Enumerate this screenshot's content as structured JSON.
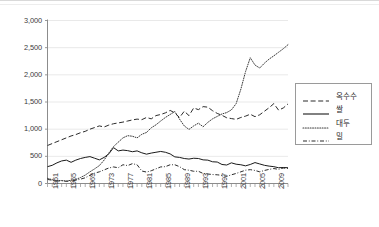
{
  "chart_data": {
    "type": "line",
    "title": "",
    "subtitle": "",
    "xlabel": "",
    "ylabel": "",
    "xlim": [
      1961,
      2012
    ],
    "ylim": [
      0,
      3000
    ],
    "grid": true,
    "grid_axis": "y",
    "legend_position": "right",
    "y_ticks": [
      0,
      500,
      1000,
      1500,
      2000,
      2500,
      3000
    ],
    "y_tick_labels": [
      "0",
      "500",
      "1,000",
      "1,500",
      "2,000",
      "2,500",
      "3,000"
    ],
    "x_tick_labels": [
      "1961",
      "1965",
      "1969",
      "1973",
      "1977",
      "1981",
      "1985",
      "1989",
      "1993",
      "1997",
      "2001",
      "2005",
      "2009"
    ],
    "x_tick_years": [
      1961,
      1965,
      1969,
      1973,
      1977,
      1981,
      1985,
      1989,
      1993,
      1997,
      2001,
      2005,
      2009
    ],
    "x": [
      1961,
      1962,
      1963,
      1964,
      1965,
      1966,
      1967,
      1968,
      1969,
      1970,
      1971,
      1972,
      1973,
      1974,
      1975,
      1976,
      1977,
      1978,
      1979,
      1980,
      1981,
      1982,
      1983,
      1984,
      1985,
      1986,
      1987,
      1988,
      1989,
      1990,
      1991,
      1992,
      1993,
      1994,
      1995,
      1996,
      1997,
      1998,
      1999,
      2000,
      2001,
      2002,
      2003,
      2004,
      2005,
      2006,
      2007,
      2008,
      2009,
      2010,
      2011,
      2012
    ],
    "series": [
      {
        "name": "옥수수",
        "style": "dashed",
        "color": "#2b2b2b",
        "values": [
          700,
          735,
          770,
          805,
          840,
          875,
          900,
          935,
          960,
          1000,
          1030,
          1060,
          1040,
          1075,
          1100,
          1115,
          1130,
          1150,
          1170,
          1185,
          1175,
          1215,
          1190,
          1250,
          1270,
          1300,
          1345,
          1300,
          1215,
          1330,
          1250,
          1390,
          1360,
          1415,
          1405,
          1340,
          1290,
          1255,
          1210,
          1195,
          1180,
          1215,
          1240,
          1275,
          1230,
          1265,
          1330,
          1395,
          1470,
          1350,
          1390,
          1465
        ]
      },
      {
        "name": "쌀",
        "style": "solid",
        "color": "#1a1a1a",
        "values": [
          310,
          335,
          380,
          415,
          430,
          390,
          430,
          460,
          480,
          495,
          465,
          435,
          480,
          545,
          660,
          600,
          615,
          605,
          585,
          600,
          565,
          540,
          560,
          575,
          590,
          575,
          545,
          490,
          480,
          460,
          450,
          465,
          460,
          435,
          430,
          400,
          395,
          350,
          340,
          380,
          355,
          345,
          325,
          350,
          385,
          360,
          335,
          320,
          310,
          290,
          295,
          290
        ]
      },
      {
        "name": "대두",
        "style": "dotted",
        "color": "#3a3a3a",
        "values": [
          95,
          70,
          50,
          55,
          45,
          60,
          75,
          110,
          155,
          215,
          270,
          330,
          430,
          560,
          680,
          760,
          840,
          880,
          870,
          840,
          905,
          940,
          1025,
          1080,
          1150,
          1215,
          1270,
          1325,
          1185,
          1060,
          995,
          1060,
          1110,
          1045,
          1125,
          1190,
          1235,
          1280,
          1305,
          1355,
          1470,
          1735,
          2060,
          2315,
          2180,
          2125,
          2215,
          2290,
          2350,
          2415,
          2480,
          2555
        ]
      },
      {
        "name": "밀",
        "style": "dashdot",
        "color": "#2b2b2b",
        "values": [
          75,
          60,
          45,
          50,
          40,
          45,
          60,
          80,
          105,
          150,
          190,
          215,
          250,
          285,
          305,
          290,
          345,
          330,
          365,
          345,
          230,
          210,
          235,
          270,
          305,
          310,
          345,
          345,
          310,
          255,
          245,
          225,
          225,
          185,
          175,
          165,
          160,
          150,
          130,
          160,
          185,
          215,
          245,
          255,
          240,
          215,
          240,
          260,
          275,
          260,
          285,
          275
        ]
      }
    ]
  },
  "legend": {
    "items": [
      {
        "label": "옥수수",
        "style": "dashed"
      },
      {
        "label": "쌀",
        "style": "solid"
      },
      {
        "label": "대두",
        "style": "dotted"
      },
      {
        "label": "밀",
        "style": "dashdot"
      }
    ]
  }
}
